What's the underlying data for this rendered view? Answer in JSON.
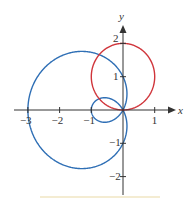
{
  "figure": {
    "type": "polar-curves-plot",
    "axes": {
      "x_label": "x",
      "y_label": "y",
      "x_ticks": [
        {
          "value": -3,
          "label": "−3"
        },
        {
          "value": -2,
          "label": "−2"
        },
        {
          "value": -1,
          "label": "−1"
        },
        {
          "value": 1,
          "label": "1"
        }
      ],
      "y_ticks": [
        {
          "value": 2,
          "label": "2"
        },
        {
          "value": 1,
          "label": "1"
        },
        {
          "value": -1,
          "label": "−1"
        },
        {
          "value": -2,
          "label": "−2"
        }
      ]
    },
    "curves": [
      {
        "name": "limacon",
        "polar_equation": "r = 1 - 2cosθ",
        "color": "#2f6fb5"
      },
      {
        "name": "circle",
        "polar_equation": "r = 2sinθ",
        "color": "#d0353b"
      }
    ],
    "colors": {
      "axis": "#333333",
      "limacon": "#2f6fb5",
      "circle": "#d0353b",
      "bottom_band": "#f4ecd2"
    }
  }
}
